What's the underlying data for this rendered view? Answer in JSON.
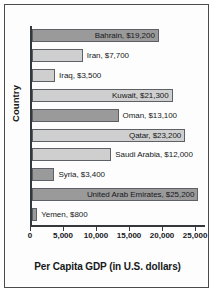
{
  "chart_data": {
    "type": "bar",
    "orientation": "horizontal",
    "title": "",
    "xlabel": "Per Capita GDP (in U.S. dollars)",
    "ylabel": "Country",
    "xlim": [
      0,
      26500
    ],
    "grid": false,
    "legend": null,
    "xticks": [
      "0",
      "5,000",
      "10,000",
      "15,000",
      "20,000",
      "25,000"
    ],
    "xtick_values": [
      0,
      5000,
      10000,
      15000,
      20000,
      25000
    ],
    "categories": [
      "Bahrain",
      "Iran",
      "Iraq",
      "Kuwait",
      "Oman",
      "Qatar",
      "Saudi Arabia",
      "Syria",
      "United Arab Emirates",
      "Yemen"
    ],
    "values": [
      19200,
      7700,
      3500,
      21300,
      13100,
      23200,
      12000,
      3400,
      25200,
      800
    ],
    "bars": [
      {
        "label": "Bahrain, $19,200",
        "value": 19200,
        "shade": "dark",
        "label_position": "inside"
      },
      {
        "label": "Iran, $7,700",
        "value": 7700,
        "shade": "light",
        "label_position": "outside"
      },
      {
        "label": "Iraq, $3,500",
        "value": 3500,
        "shade": "light",
        "label_position": "outside"
      },
      {
        "label": "Kuwait, $21,300",
        "value": 21300,
        "shade": "light",
        "label_position": "inside"
      },
      {
        "label": "Oman, $13,100",
        "value": 13100,
        "shade": "dark",
        "label_position": "outside"
      },
      {
        "label": "Qatar, $23,200",
        "value": 23200,
        "shade": "light",
        "label_position": "inside"
      },
      {
        "label": "Saudi Arabia, $12,000",
        "value": 12000,
        "shade": "light",
        "label_position": "outside"
      },
      {
        "label": "Syria, $3,400",
        "value": 3400,
        "shade": "dark",
        "label_position": "outside"
      },
      {
        "label": "United Arab Emirates, $25,200",
        "value": 25200,
        "shade": "dark",
        "label_position": "inside"
      },
      {
        "label": "Yemen, $800",
        "value": 800,
        "shade": "dark",
        "label_position": "outside"
      }
    ],
    "colors": {
      "bar_dark": "#9a9a9a",
      "bar_light": "#cfcfcf",
      "bar_border": "#5d6166",
      "axis": "#33383d",
      "text": "#16181a",
      "frame": "#4a4a4a",
      "background": "#ffffff"
    }
  }
}
